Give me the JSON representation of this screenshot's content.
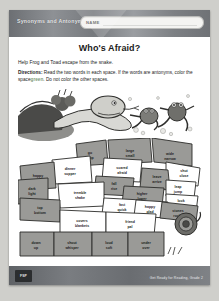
{
  "header": {
    "series_title": "Synonyms and Antonyms",
    "name_label": "NAME"
  },
  "worksheet": {
    "title": "Who's Afraid?",
    "lead": "Help Frog and Toad escape from the snake.",
    "directions_label": "Directions:",
    "directions_part1": "Read the two words in each space. If the words are antonyms, color the space",
    "directions_color_word": "green",
    "directions_part2": ". Do not color the other spaces."
  },
  "illustration": {
    "alt": "snake chasing frog and toad",
    "caption": ""
  },
  "maze": {
    "color_fill": "#9a9a97",
    "color_blank": "#ffffff",
    "cells": [
      {
        "id": "c1",
        "word_top": "go",
        "word_bottom": "stop",
        "filled": true,
        "x": 72,
        "y": 16
      },
      {
        "id": "c2",
        "word_top": "large",
        "word_bottom": "small",
        "filled": true,
        "x": 112,
        "y": 14
      },
      {
        "id": "c3",
        "word_top": "wide",
        "word_bottom": "narrow",
        "filled": true,
        "x": 152,
        "y": 17
      },
      {
        "id": "c4",
        "word_top": "dinner",
        "word_bottom": "supper",
        "filled": false,
        "x": 52,
        "y": 32
      },
      {
        "id": "c5",
        "word_top": "scared",
        "word_bottom": "afraid",
        "filled": false,
        "x": 104,
        "y": 31
      },
      {
        "id": "c6",
        "word_top": "shut",
        "word_bottom": "close",
        "filled": false,
        "x": 166,
        "y": 34
      },
      {
        "id": "c7",
        "word_top": "happy",
        "word_bottom": "sad",
        "filled": true,
        "x": 20,
        "y": 39
      },
      {
        "id": "c8",
        "word_top": "leave",
        "word_bottom": "arrive",
        "filled": true,
        "x": 139,
        "y": 40
      },
      {
        "id": "c9",
        "word_top": "dark",
        "word_bottom": "light",
        "filled": true,
        "x": 14,
        "y": 52
      },
      {
        "id": "c10",
        "word_top": "fall",
        "word_bottom": "rise",
        "filled": true,
        "x": 96,
        "y": 47
      },
      {
        "id": "c11",
        "word_top": "leap",
        "word_bottom": "jump",
        "filled": false,
        "x": 160,
        "y": 50
      },
      {
        "id": "c12",
        "word_top": "tremble",
        "word_bottom": "shake",
        "filled": false,
        "x": 62,
        "y": 56
      },
      {
        "id": "c13",
        "word_top": "higher",
        "word_bottom": "lower",
        "filled": true,
        "x": 124,
        "y": 57
      },
      {
        "id": "c14",
        "word_top": "look",
        "word_bottom": "see",
        "filled": false,
        "x": 163,
        "y": 64
      },
      {
        "id": "c15",
        "word_top": "fast",
        "word_bottom": "quick",
        "filled": false,
        "x": 104,
        "y": 68
      },
      {
        "id": "c16",
        "word_top": "happy",
        "word_bottom": "glad",
        "filled": false,
        "x": 132,
        "y": 70
      },
      {
        "id": "c17",
        "word_top": "top",
        "word_bottom": "bottom",
        "filled": true,
        "x": 22,
        "y": 71
      },
      {
        "id": "c18",
        "word_top": "stones",
        "word_bottom": "rocks",
        "filled": true,
        "x": 160,
        "y": 74
      },
      {
        "id": "c19",
        "word_top": "covers",
        "word_bottom": "blankets",
        "filled": false,
        "x": 64,
        "y": 84
      },
      {
        "id": "c20",
        "word_top": "friend",
        "word_bottom": "pal",
        "filled": false,
        "x": 112,
        "y": 85
      },
      {
        "id": "c21",
        "word_top": "down",
        "word_bottom": "up",
        "filled": true,
        "x": 18,
        "y": 106
      },
      {
        "id": "c22",
        "word_top": "shout",
        "word_bottom": "whisper",
        "filled": true,
        "x": 54,
        "y": 106
      },
      {
        "id": "c23",
        "word_top": "loud",
        "word_bottom": "soft",
        "filled": true,
        "x": 91,
        "y": 106
      },
      {
        "id": "c24",
        "word_top": "under",
        "word_bottom": "over",
        "filled": true,
        "x": 128,
        "y": 106
      }
    ]
  },
  "footer": {
    "logo_text": "FSP",
    "credit": "Get Ready for Reading, Grade 2"
  }
}
